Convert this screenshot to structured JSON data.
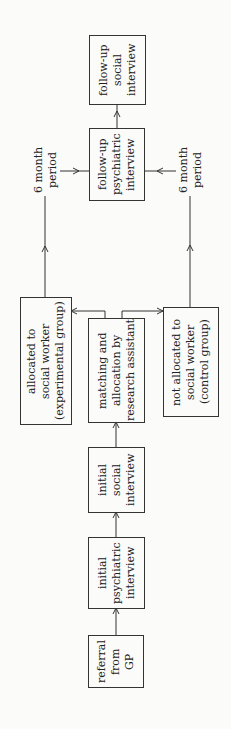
{
  "diagram": {
    "type": "flowchart",
    "orientation": "rotated-90-ccw",
    "nodes": {
      "referral": "referral\nfrom\nGP",
      "initial_psychiatric": "initial\npsychiatric\ninterview",
      "initial_social": "initial\nsocial\ninterview",
      "matching": "matching and\nallocation by\nresearch assistant",
      "experimental": "allocated to\nsocial worker\n(experimental group)",
      "control": "not allocated to\nsocial worker\n(control group)",
      "followup_psychiatric": "follow-up\npsychiatric\ninterview",
      "followup_social": "follow-up\nsocial\ninterview"
    },
    "labels": {
      "period_top": "6 month\nperiod",
      "period_bottom": "6 month\nperiod"
    },
    "edges": [
      [
        "referral",
        "initial_psychiatric"
      ],
      [
        "initial_psychiatric",
        "initial_social"
      ],
      [
        "initial_social",
        "matching"
      ],
      [
        "matching",
        "experimental"
      ],
      [
        "matching",
        "control"
      ],
      [
        "experimental",
        "followup_psychiatric"
      ],
      [
        "control",
        "followup_psychiatric"
      ],
      [
        "followup_psychiatric",
        "followup_social"
      ]
    ]
  }
}
